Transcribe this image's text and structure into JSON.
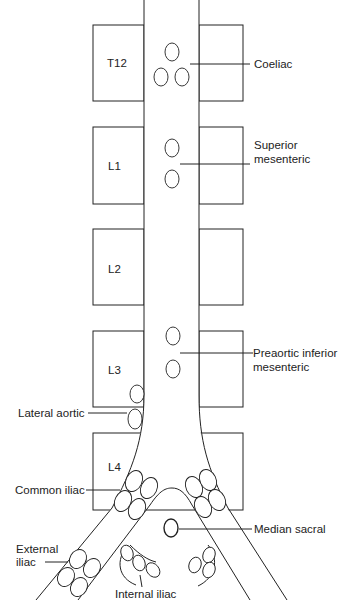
{
  "figure": {
    "vertebrae": [
      {
        "id": "T12",
        "label": "T12"
      },
      {
        "id": "L1",
        "label": "L1"
      },
      {
        "id": "L2",
        "label": "L2"
      },
      {
        "id": "L3",
        "label": "L3"
      },
      {
        "id": "L4",
        "label": "L4"
      }
    ],
    "labels": {
      "coeliac": "Coeliac",
      "superior_mesenteric_1": "Superior",
      "superior_mesenteric_2": "mesenteric",
      "preaortic_inferior_1": "Preaortic inferior",
      "preaortic_inferior_2": "mesenteric",
      "lateral_aortic": "Lateral aortic",
      "common_iliac": "Common iliac",
      "median_sacral": "Median sacral",
      "external_iliac_1": "External",
      "external_iliac_2": "iliac",
      "internal_iliac": "Internal iliac"
    },
    "colors": {
      "line": "#222222",
      "background": "#ffffff"
    }
  }
}
